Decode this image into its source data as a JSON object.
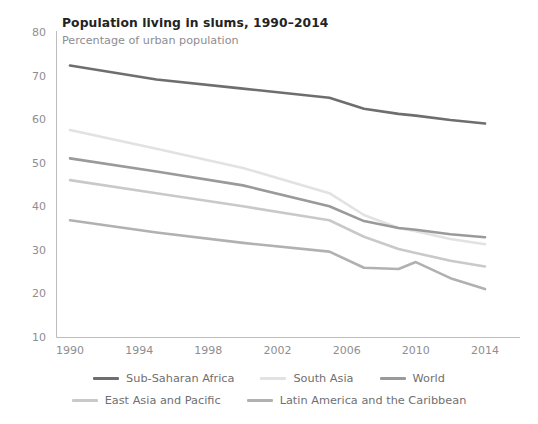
{
  "chart_data": {
    "type": "line",
    "title": "Population living in slums, 1990–2014",
    "subtitle": "Percentage of urban population",
    "xlabel": "",
    "ylabel": "",
    "xlim": [
      1990,
      2014
    ],
    "ylim": [
      10,
      80
    ],
    "grid": false,
    "legend_position": "bottom",
    "x_ticks": [
      "1990",
      "1994",
      "1998",
      "2002",
      "2006",
      "2010",
      "2014"
    ],
    "y_ticks": [
      "10",
      "20",
      "30",
      "40",
      "50",
      "60",
      "70",
      "80"
    ],
    "x": [
      1990,
      1995,
      2000,
      2005,
      2007,
      2009,
      2010,
      2012,
      2014
    ],
    "series": [
      {
        "name": "Sub-Saharan Africa",
        "color": "#6e6e70",
        "values": [
          72.3,
          69.1,
          67.0,
          64.9,
          62.4,
          61.2,
          60.8,
          59.8,
          59.0
        ]
      },
      {
        "name": "South Asia",
        "color": "#e2e2e2",
        "values": [
          57.5,
          53.2,
          48.8,
          43.0,
          38.0,
          35.0,
          34.3,
          32.5,
          31.3
        ]
      },
      {
        "name": "World",
        "color": "#9a9a9c",
        "values": [
          51.0,
          48.0,
          44.8,
          40.0,
          36.6,
          35.0,
          34.6,
          33.6,
          32.9
        ]
      },
      {
        "name": "East Asia and Pacific",
        "color": "#c9c9c9",
        "values": [
          46.0,
          43.0,
          40.0,
          36.8,
          33.0,
          30.2,
          29.3,
          27.5,
          26.2
        ]
      },
      {
        "name": "Latin America and the Caribbean",
        "color": "#b1b1b3",
        "values": [
          36.8,
          34.0,
          31.6,
          29.6,
          25.9,
          25.6,
          27.2,
          23.5,
          21.0
        ]
      }
    ]
  },
  "legend": {
    "row1": [
      {
        "label": "Sub-Saharan Africa",
        "color": "#6e6e70"
      },
      {
        "label": "South Asia",
        "color": "#e2e2e2"
      },
      {
        "label": "World",
        "color": "#9a9a9c"
      }
    ],
    "row2": [
      {
        "label": "East Asia and Pacific",
        "color": "#c9c9c9"
      },
      {
        "label": "Latin America and the Caribbean",
        "color": "#b1b1b3"
      }
    ]
  }
}
